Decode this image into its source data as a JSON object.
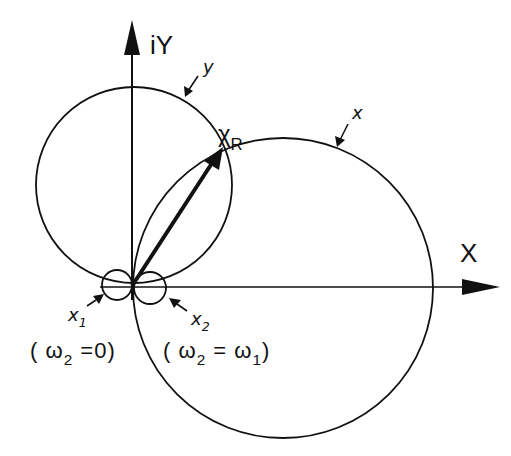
{
  "diagram": {
    "type": "complex-plane admittance locus",
    "axes": {
      "horizontal": {
        "label": "X"
      },
      "vertical": {
        "label": "iY"
      }
    },
    "curves": [
      {
        "id": "y",
        "label": "y",
        "shape": "circle"
      },
      {
        "id": "x",
        "label": "x",
        "shape": "circle"
      },
      {
        "id": "x1",
        "label": "x",
        "subscript": "1",
        "shape": "small circle",
        "condition": "(ω₂ = 0)"
      },
      {
        "id": "x2",
        "label": "x",
        "subscript": "2",
        "shape": "small circle",
        "condition": "(ω₂ = ω₁)"
      }
    ],
    "vector": {
      "label": "χ",
      "subscript": "R"
    },
    "labels": {
      "iY": "iY",
      "X": "X",
      "y": "y",
      "x": "x",
      "chi": "χ",
      "chi_sub": "R",
      "x1": "x",
      "x1_sub": "1",
      "x2": "x",
      "x2_sub": "2",
      "cond1_open": "( ω",
      "cond1_sub": "2",
      "cond1_rest": " =0)",
      "cond2_open": "( ω",
      "cond2_sub": "2",
      "cond2_mid": " = ω",
      "cond2_sub2": "1",
      "cond2_close": ")"
    }
  }
}
